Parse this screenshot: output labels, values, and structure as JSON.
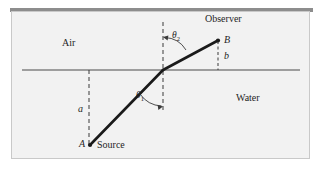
{
  "figure": {
    "background_color": "#f2f2f2",
    "frame_color": "#c9c9c9",
    "ray_color": "#1a1a1a",
    "line_color": "#4a4a4a"
  },
  "labels": {
    "air": "Air",
    "water": "Water",
    "observer": "Observer",
    "source": "Source",
    "point_a": "A",
    "point_b": "B",
    "dist_a": "a",
    "dist_b": "b",
    "theta1": "θ",
    "theta1_sub": "1",
    "theta2": "θ",
    "theta2_sub": "2"
  },
  "geometry": {
    "interface_y": 70,
    "interface_x1": 22,
    "interface_x2": 300,
    "refraction_point": [
      163,
      70
    ],
    "point_a": [
      89,
      145
    ],
    "point_b": [
      218,
      40
    ],
    "normal_x": 163,
    "normal_y_top": 22,
    "normal_y_bottom": 113,
    "a_dashed_x": 89,
    "b_dashed_x": 218
  }
}
